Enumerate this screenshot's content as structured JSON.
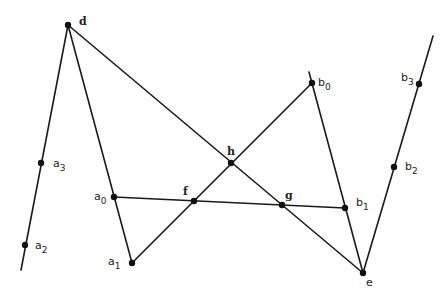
{
  "diagram": {
    "type": "geometric-construction",
    "points": [
      {
        "id": "d",
        "base": "d",
        "sub": "",
        "x": 68,
        "y": 25,
        "lx": 79,
        "ly": 25,
        "style": "serif"
      },
      {
        "id": "a3",
        "base": "a",
        "sub": "3",
        "x": 41,
        "y": 163,
        "lx": 53,
        "ly": 167,
        "style": "sans"
      },
      {
        "id": "a2",
        "base": "a",
        "sub": "2",
        "x": 25,
        "y": 245,
        "lx": 35,
        "ly": 249,
        "style": "sans"
      },
      {
        "id": "a0",
        "base": "a",
        "sub": "0",
        "x": 114,
        "y": 197,
        "lx": 94,
        "ly": 200,
        "style": "sans"
      },
      {
        "id": "a1",
        "base": "a",
        "sub": "1",
        "x": 132,
        "y": 263,
        "lx": 108,
        "ly": 265,
        "style": "sans"
      },
      {
        "id": "f",
        "base": "f",
        "sub": "",
        "x": 194,
        "y": 201,
        "lx": 183,
        "ly": 195,
        "style": "serif"
      },
      {
        "id": "h",
        "base": "h",
        "sub": "",
        "x": 231,
        "y": 163,
        "lx": 227,
        "ly": 155,
        "style": "serif"
      },
      {
        "id": "g",
        "base": "g",
        "sub": "",
        "x": 282,
        "y": 205,
        "lx": 285,
        "ly": 199,
        "style": "serif"
      },
      {
        "id": "b0",
        "base": "b",
        "sub": "0",
        "x": 312,
        "y": 83,
        "lx": 318,
        "ly": 86,
        "style": "sans"
      },
      {
        "id": "b1",
        "base": "b",
        "sub": "1",
        "x": 345,
        "y": 208,
        "lx": 356,
        "ly": 206,
        "style": "sans"
      },
      {
        "id": "b2",
        "base": "b",
        "sub": "2",
        "x": 394,
        "y": 167,
        "lx": 405,
        "ly": 170,
        "style": "sans"
      },
      {
        "id": "b3",
        "base": "b",
        "sub": "3",
        "x": 419,
        "y": 84,
        "lx": 401,
        "ly": 81,
        "style": "sans"
      },
      {
        "id": "e",
        "base": "e",
        "sub": "",
        "x": 363,
        "y": 273,
        "lx": 366,
        "ly": 286,
        "style": "sans"
      }
    ],
    "segments": [
      {
        "from": [
          68,
          25
        ],
        "to": [
          21,
          270
        ]
      },
      {
        "from": [
          68,
          25
        ],
        "to": [
          132,
          263
        ]
      },
      {
        "from": [
          68,
          25
        ],
        "to": [
          363,
          273
        ]
      },
      {
        "from": [
          132,
          263
        ],
        "to": [
          312,
          83
        ]
      },
      {
        "from": [
          114,
          197
        ],
        "to": [
          345,
          208
        ]
      },
      {
        "from": [
          309,
          72
        ],
        "to": [
          363,
          273
        ]
      },
      {
        "from": [
          363,
          273
        ],
        "to": [
          433,
          36
        ]
      }
    ],
    "colors": {
      "line": "#1a1a1a",
      "point": "#111111",
      "background": "#ffffff"
    }
  }
}
